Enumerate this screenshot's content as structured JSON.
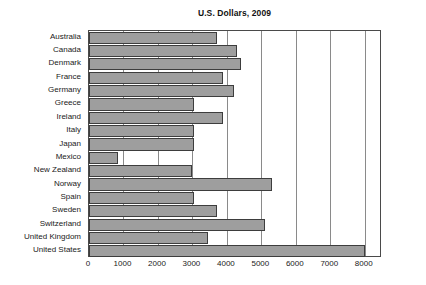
{
  "chart_data": {
    "type": "bar",
    "orientation": "horizontal",
    "title": "U.S. Dollars, 2009",
    "xlabel": "",
    "ylabel": "",
    "xlim": [
      0,
      8500
    ],
    "grid": true,
    "legend": null,
    "xticks": [
      0,
      1000,
      2000,
      3000,
      4000,
      5000,
      6000,
      7000,
      8000
    ],
    "xtick_labels": [
      "0",
      "1000",
      "2000",
      "3000",
      "4000",
      "5000",
      "6000",
      "7000",
      "8000"
    ],
    "categories": [
      "Australia",
      "Canada",
      "Denmark",
      "France",
      "Germany",
      "Greece",
      "Ireland",
      "Italy",
      "Japan",
      "Mexico",
      "New Zealand",
      "Norway",
      "Spain",
      "Sweden",
      "Switzerland",
      "United Kingdom",
      "United States"
    ],
    "values": [
      3700,
      4300,
      4400,
      3900,
      4200,
      3050,
      3900,
      3050,
      3050,
      850,
      3000,
      5300,
      3050,
      3700,
      5100,
      3450,
      8000
    ],
    "bar_color": "#9e9e9e",
    "bar_edge_color": "#3d3d3d",
    "grid_color": "#8a8a8a",
    "frame_color": "#4a4a4a",
    "background_color": "#ffffff"
  }
}
